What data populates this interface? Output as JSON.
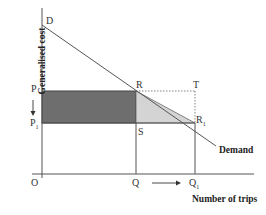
{
  "axes": {
    "y_label": "Generalised cost",
    "x_label": "Number of trips",
    "origin_label": "O"
  },
  "points": {
    "D": "D",
    "P": "P",
    "P1": "P",
    "P1_sub": "1",
    "R": "R",
    "R1": "R",
    "R1_sub": "1",
    "S": "S",
    "T": "T",
    "Q": "Q",
    "Q1": "Q",
    "Q1_sub": "1"
  },
  "curve_label": "Demand",
  "colors": {
    "dark_rect": "#6e6e6e",
    "light_triangle": "#d4d4d4",
    "lines": "#555555"
  }
}
